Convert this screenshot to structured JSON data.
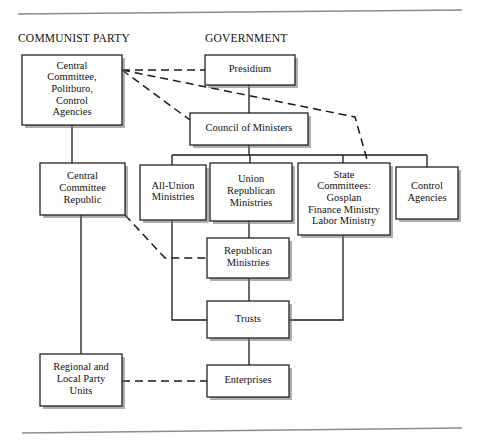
{
  "document": {
    "title": "Soviet Party-State Administrative Structure",
    "top_rule": true,
    "bottom_rule": true
  },
  "headings": [
    {
      "id": "communist-party",
      "label": "COMMUNIST PARTY",
      "x": 18,
      "y": 42
    },
    {
      "id": "government",
      "label": "GOVERNMENT",
      "x": 205,
      "y": 42
    }
  ],
  "nodes": [
    {
      "id": "central-committee-politburo",
      "lines": [
        "Central",
        "Committee,",
        "Politburo,",
        "Control",
        "Agencies"
      ],
      "x": 22,
      "y": 55,
      "w": 100,
      "h": 70,
      "column": "party"
    },
    {
      "id": "presidium",
      "lines": [
        "Presidium"
      ],
      "x": 205,
      "y": 55,
      "w": 90,
      "h": 30,
      "column": "government"
    },
    {
      "id": "council-of-ministers",
      "lines": [
        "Council of Ministers"
      ],
      "x": 190,
      "y": 113,
      "w": 118,
      "h": 32,
      "column": "government"
    },
    {
      "id": "central-committee-republic",
      "lines": [
        "Central",
        "Committee",
        "Republic"
      ],
      "x": 40,
      "y": 163,
      "w": 85,
      "h": 52,
      "column": "party"
    },
    {
      "id": "all-union-ministries",
      "lines": [
        "All-Union",
        "Ministries"
      ],
      "x": 140,
      "y": 165,
      "w": 66,
      "h": 55,
      "column": "government"
    },
    {
      "id": "union-republican-ministries",
      "lines": [
        "Union",
        "Republican",
        "Ministries"
      ],
      "x": 210,
      "y": 163,
      "w": 82,
      "h": 58,
      "column": "government"
    },
    {
      "id": "state-committees",
      "lines": [
        "State",
        "Committees:",
        "Gosplan",
        "Finance Ministry",
        "Labor Ministry"
      ],
      "x": 298,
      "y": 163,
      "w": 92,
      "h": 72,
      "column": "government"
    },
    {
      "id": "control-agencies",
      "lines": [
        "Control",
        "Agencies"
      ],
      "x": 396,
      "y": 167,
      "w": 62,
      "h": 52,
      "column": "government"
    },
    {
      "id": "republican-ministries",
      "lines": [
        "Republican",
        "Ministries"
      ],
      "x": 207,
      "y": 238,
      "w": 82,
      "h": 40,
      "column": "government"
    },
    {
      "id": "trusts",
      "lines": [
        "Trusts"
      ],
      "x": 207,
      "y": 301,
      "w": 82,
      "h": 37,
      "column": "government"
    },
    {
      "id": "regional-local-party-units",
      "lines": [
        "Regional and",
        "Local Party",
        "Units"
      ],
      "x": 40,
      "y": 354,
      "w": 82,
      "h": 52,
      "column": "party"
    },
    {
      "id": "enterprises",
      "lines": [
        "Enterprises"
      ],
      "x": 207,
      "y": 365,
      "w": 82,
      "h": 32,
      "column": "government"
    }
  ],
  "links": [
    {
      "id": "cc-to-ccrepublic",
      "style": "solid",
      "from": "central-committee-politburo",
      "to": "central-committee-republic",
      "path": "M 72 125 L 72 163"
    },
    {
      "id": "ccrepublic-to-regional",
      "style": "solid",
      "from": "central-committee-republic",
      "to": "regional-local-party-units",
      "path": "M 81 215 L 81 354"
    },
    {
      "id": "presidium-to-council",
      "style": "solid",
      "from": "presidium",
      "to": "council-of-ministers",
      "path": "M 249 85 L 249 113"
    },
    {
      "id": "council-bus",
      "style": "solid",
      "from": "council-of-ministers",
      "to": "ministries-row",
      "path": "M 249 145 L 249 155 M 172 155 L 427 155 M 172 155 L 172 165 M 250 155 L 250 163 M 343 155 L 343 163 M 427 155 L 427 167"
    },
    {
      "id": "union-republican-to-republican",
      "style": "solid",
      "from": "union-republican-ministries",
      "to": "republican-ministries",
      "path": "M 249 221 L 249 238"
    },
    {
      "id": "republican-to-trusts",
      "style": "solid",
      "from": "republican-ministries",
      "to": "trusts",
      "path": "M 249 278 L 249 301"
    },
    {
      "id": "allunion-to-trusts",
      "style": "solid",
      "from": "all-union-ministries",
      "to": "trusts",
      "path": "M 172 220 L 172 320 L 207 320"
    },
    {
      "id": "statecommittees-to-trusts",
      "style": "solid",
      "from": "state-committees",
      "to": "trusts",
      "path": "M 343 235 L 343 320 L 289 320"
    },
    {
      "id": "trusts-to-enterprises",
      "style": "solid",
      "from": "trusts",
      "to": "enterprises",
      "path": "M 249 338 L 249 365"
    },
    {
      "id": "cc-to-presidium",
      "style": "dashed",
      "from": "central-committee-politburo",
      "to": "presidium",
      "path": "M 122 70 L 205 70"
    },
    {
      "id": "cc-to-council",
      "style": "dashed",
      "from": "central-committee-politburo",
      "to": "council-of-ministers",
      "path": "M 122 70 L 190 120"
    },
    {
      "id": "cc-to-statecommittees",
      "style": "dashed",
      "from": "central-committee-politburo",
      "to": "state-committees",
      "path": "M 122 70 L 355 117 L 368 163"
    },
    {
      "id": "ccrepublic-to-republican",
      "style": "dashed",
      "from": "central-committee-republic",
      "to": "republican-ministries",
      "path": "M 125 215 L 165 258 L 207 258"
    },
    {
      "id": "regional-to-enterprises",
      "style": "dashed",
      "from": "regional-local-party-units",
      "to": "enterprises",
      "path": "M 122 381 L 207 381"
    }
  ],
  "rules": [
    {
      "id": "top-rule",
      "path": "M 18 14 L 462 10"
    },
    {
      "id": "bottom-rule",
      "path": "M 22 433 L 462 428"
    }
  ]
}
